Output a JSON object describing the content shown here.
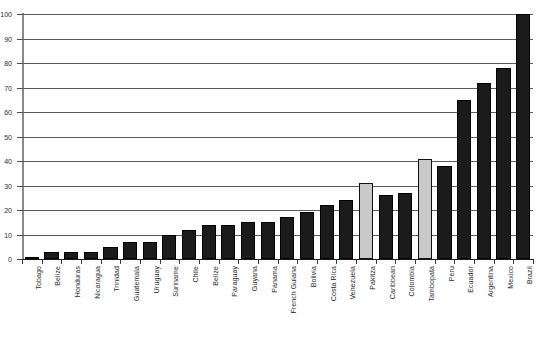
{
  "chart_data": {
    "type": "bar",
    "title": "",
    "subtitle": "",
    "xlabel": "",
    "ylabel": "",
    "ylim": [
      0,
      100
    ],
    "ytick_step": 10,
    "ytick_labels": [
      "0",
      "10",
      "20",
      "30",
      "40",
      "50",
      "60",
      "70",
      "80",
      "90",
      "100"
    ],
    "ytick_values": [
      0,
      10,
      20,
      30,
      40,
      50,
      60,
      70,
      80,
      90,
      100
    ],
    "grid": true,
    "legend": "none",
    "note": "Y-axis tick labels are clipped at the left edge of the screenshot; only the trailing digit of each label is visible.",
    "categories": [
      "Tobago",
      "Belize",
      "Honduras",
      "Nicaragua",
      "Trinidad",
      "Guatemala",
      "Uruguay",
      "Suriname",
      "Chile",
      "Belize",
      "Paraguay",
      "Guyana",
      "Panama",
      "French Guiana",
      "Bolivia",
      "Costa Rica",
      "Venezuela",
      "Pakitza",
      "Caribbean",
      "Colombia",
      "Tambopata",
      "Peru",
      "Ecuador",
      "Argentina",
      "Mexico",
      "Brazil"
    ],
    "values": [
      1,
      3,
      3,
      3,
      5,
      7,
      7,
      10,
      12,
      14,
      14,
      15,
      15,
      17,
      19,
      22,
      24,
      31,
      26,
      27,
      41,
      38,
      65,
      72,
      78,
      100
    ],
    "bar_styles": [
      "solid",
      "solid",
      "solid",
      "solid",
      "solid",
      "solid",
      "solid",
      "solid",
      "solid",
      "solid",
      "solid",
      "solid",
      "solid",
      "solid",
      "solid",
      "solid",
      "solid",
      "light",
      "solid",
      "solid",
      "light",
      "solid",
      "solid",
      "solid",
      "solid",
      "solid"
    ],
    "colors": {
      "bar_solid": "#1b1b1b",
      "bar_light": "#c9c9c9",
      "bar_outline": "#000000",
      "gridline": "#5a5a5a",
      "axis": "#8a8a8a",
      "background": "#ffffff",
      "text": "#1f1f1f"
    }
  }
}
